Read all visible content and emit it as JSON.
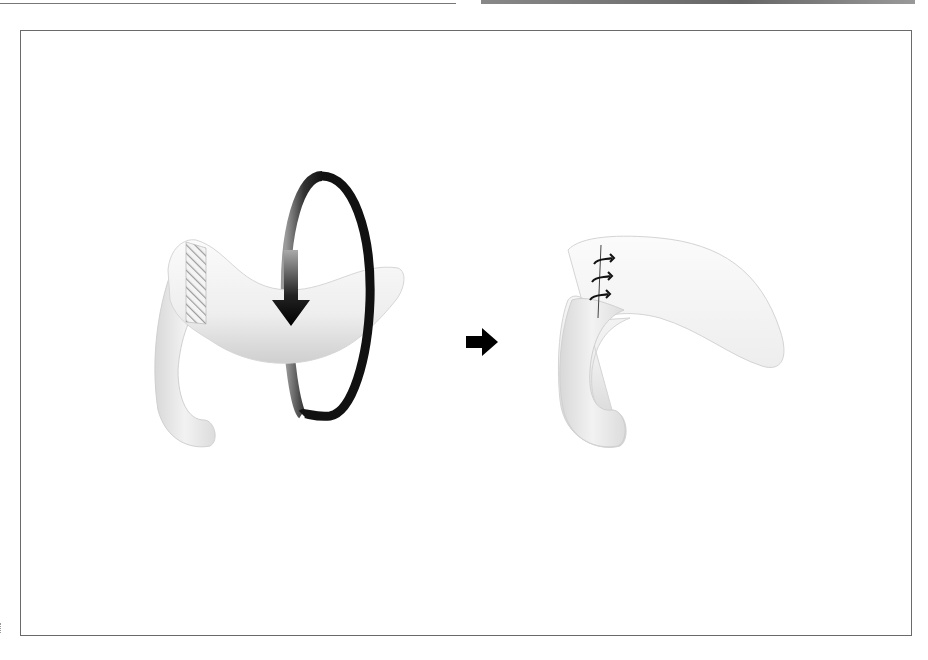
{
  "figure": {
    "left_panel": {
      "label": "",
      "description": "flap rotated around vertical axis",
      "hatched_region": "excision-zone",
      "rotation_arrow": "rotate-180-arrow"
    },
    "transition_arrow": "right-arrow-icon",
    "right_panel": {
      "label": "",
      "description": "rotated flap sutured",
      "sutures": 3
    },
    "colors": {
      "frame": "#6a6a6a",
      "arrow": "#000000",
      "tissue_light": "#f4f4f4",
      "tissue_shadow": "#c8c8c8"
    }
  }
}
